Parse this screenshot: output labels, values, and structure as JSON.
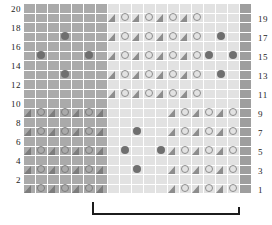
{
  "chart_data": {
    "type": "heatmap",
    "title": "",
    "xlabel": "",
    "ylabel": "",
    "columns": 19,
    "rows": 20,
    "row_numbers_left": [
      20,
      18,
      16,
      14,
      12,
      10,
      8,
      6,
      4,
      2
    ],
    "row_numbers_right": [
      19,
      17,
      15,
      13,
      11,
      9,
      7,
      5,
      3,
      1
    ],
    "legend": [],
    "colors": {
      "block_dark": "#aaaaaa",
      "block_light": "#e2e2e2",
      "block_mid": "#d7d7d7",
      "edge_column": "#9e9e9e",
      "grid_line": "#ffffff",
      "symbol_outline": "#8d8d8d",
      "filled_dot": "#6f6f6f",
      "bracket": "#1c1c1c",
      "text": "#222222"
    },
    "symbols": {
      "triangle": "decrease",
      "circle": "yarn-over",
      "dot": "bobble"
    },
    "grid": [
      {
        "row": 20,
        "cells": [
          "d",
          "d",
          "d",
          "d",
          "d",
          "d",
          "d",
          "l",
          "l",
          "l",
          "l",
          "l",
          "l",
          "l",
          "l",
          "l",
          "l",
          "l",
          "e"
        ]
      },
      {
        "row": 19,
        "cells": [
          "d",
          "d",
          "d",
          "d",
          "d",
          "d",
          "d",
          "T",
          "O",
          "T",
          "O",
          "T",
          "O",
          "T",
          "O",
          "l",
          "l",
          "l",
          "e"
        ]
      },
      {
        "row": 18,
        "cells": [
          "d",
          "d",
          "d",
          "d",
          "d",
          "d",
          "d",
          "l",
          "l",
          "l",
          "l",
          "l",
          "l",
          "l",
          "l",
          "l",
          "l",
          "l",
          "e"
        ]
      },
      {
        "row": 17,
        "cells": [
          "d",
          "d",
          "d",
          "B",
          "d",
          "d",
          "d",
          "T",
          "O",
          "T",
          "O",
          "T",
          "O",
          "T",
          "O",
          "l",
          "B",
          "l",
          "e"
        ]
      },
      {
        "row": 16,
        "cells": [
          "d",
          "d",
          "d",
          "d",
          "d",
          "d",
          "d",
          "l",
          "l",
          "l",
          "l",
          "l",
          "l",
          "l",
          "l",
          "l",
          "l",
          "l",
          "e"
        ]
      },
      {
        "row": 15,
        "cells": [
          "d",
          "B",
          "d",
          "d",
          "d",
          "B",
          "d",
          "T",
          "O",
          "T",
          "O",
          "T",
          "O",
          "T",
          "O",
          "B",
          "l",
          "B",
          "e"
        ]
      },
      {
        "row": 14,
        "cells": [
          "d",
          "d",
          "d",
          "d",
          "d",
          "d",
          "d",
          "l",
          "l",
          "l",
          "l",
          "l",
          "l",
          "l",
          "l",
          "l",
          "l",
          "l",
          "e"
        ]
      },
      {
        "row": 13,
        "cells": [
          "d",
          "d",
          "d",
          "B",
          "d",
          "d",
          "d",
          "T",
          "O",
          "T",
          "O",
          "T",
          "O",
          "T",
          "O",
          "l",
          "B",
          "l",
          "e"
        ]
      },
      {
        "row": 12,
        "cells": [
          "d",
          "d",
          "d",
          "d",
          "d",
          "d",
          "d",
          "l",
          "l",
          "l",
          "l",
          "l",
          "l",
          "l",
          "l",
          "l",
          "l",
          "l",
          "e"
        ]
      },
      {
        "row": 11,
        "cells": [
          "d",
          "d",
          "d",
          "d",
          "d",
          "d",
          "d",
          "T",
          "O",
          "T",
          "O",
          "T",
          "O",
          "T",
          "O",
          "l",
          "l",
          "l",
          "e"
        ]
      },
      {
        "row": 10,
        "cells": [
          "d",
          "d",
          "d",
          "d",
          "d",
          "d",
          "d",
          "l",
          "l",
          "l",
          "l",
          "l",
          "l",
          "l",
          "l",
          "l",
          "l",
          "l",
          "e"
        ]
      },
      {
        "row": 9,
        "cells": [
          "T",
          "O",
          "T",
          "O",
          "T",
          "O",
          "T",
          "l",
          "l",
          "l",
          "l",
          "l",
          "T",
          "O",
          "T",
          "O",
          "T",
          "O",
          "e"
        ]
      },
      {
        "row": 8,
        "cells": [
          "d",
          "d",
          "d",
          "d",
          "d",
          "d",
          "d",
          "l",
          "l",
          "l",
          "l",
          "l",
          "l",
          "l",
          "l",
          "l",
          "l",
          "l",
          "e"
        ]
      },
      {
        "row": 7,
        "cells": [
          "T",
          "O",
          "T",
          "O",
          "T",
          "O",
          "T",
          "l",
          "l",
          "B",
          "l",
          "l",
          "T",
          "O",
          "T",
          "O",
          "T",
          "O",
          "e"
        ]
      },
      {
        "row": 6,
        "cells": [
          "d",
          "d",
          "d",
          "d",
          "d",
          "d",
          "d",
          "l",
          "l",
          "l",
          "l",
          "l",
          "l",
          "l",
          "l",
          "l",
          "l",
          "l",
          "e"
        ]
      },
      {
        "row": 5,
        "cells": [
          "T",
          "O",
          "T",
          "O",
          "T",
          "O",
          "T",
          "l",
          "B",
          "l",
          "l",
          "B",
          "T",
          "O",
          "T",
          "O",
          "T",
          "O",
          "e"
        ]
      },
      {
        "row": 4,
        "cells": [
          "d",
          "d",
          "d",
          "d",
          "d",
          "d",
          "d",
          "l",
          "l",
          "l",
          "l",
          "l",
          "l",
          "l",
          "l",
          "l",
          "l",
          "l",
          "e"
        ]
      },
      {
        "row": 3,
        "cells": [
          "T",
          "O",
          "T",
          "O",
          "T",
          "O",
          "T",
          "l",
          "l",
          "B",
          "l",
          "l",
          "T",
          "O",
          "T",
          "O",
          "T",
          "O",
          "e"
        ]
      },
      {
        "row": 2,
        "cells": [
          "d",
          "d",
          "d",
          "d",
          "d",
          "d",
          "d",
          "l",
          "l",
          "l",
          "l",
          "l",
          "l",
          "l",
          "l",
          "l",
          "l",
          "l",
          "e"
        ]
      },
      {
        "row": 1,
        "cells": [
          "T",
          "O",
          "T",
          "O",
          "T",
          "O",
          "T",
          "l",
          "l",
          "l",
          "l",
          "l",
          "T",
          "O",
          "T",
          "O",
          "T",
          "O",
          "e"
        ]
      }
    ]
  },
  "repeat": {
    "label": "",
    "start_column": 6,
    "end_column": 17
  }
}
